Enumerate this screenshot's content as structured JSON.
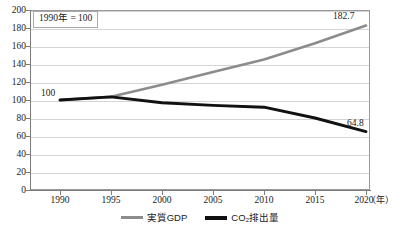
{
  "chart_data": {
    "type": "line",
    "title": "",
    "subtitle": "",
    "note": "1990年 = 100",
    "xlabel": "年",
    "ylabel": "",
    "x": [
      1990,
      1995,
      2000,
      2005,
      2010,
      2015,
      2020
    ],
    "categories": [
      "1990",
      "1995",
      "2000",
      "2005",
      "2010",
      "2015",
      "2020"
    ],
    "xlim": [
      1988,
      2021.5
    ],
    "ylim": [
      0,
      200
    ],
    "yticks": [
      0,
      20,
      40,
      60,
      80,
      100,
      120,
      140,
      160,
      180,
      200
    ],
    "ytick_labels": [
      "0",
      "20",
      "40",
      "60",
      "80",
      "100",
      "120",
      "140",
      "160",
      "180",
      "200"
    ],
    "grid": true,
    "legend_position": "bottom-center",
    "series": [
      {
        "name": "実質GDP",
        "color": "#8c8c8c",
        "values": [
          100.0,
          103.5,
          117.0,
          131.0,
          145.0,
          163.0,
          182.7
        ]
      },
      {
        "name": "CO₂排出量",
        "color": "#111111",
        "values": [
          100.0,
          103.5,
          97.0,
          94.0,
          92.0,
          80.0,
          64.8
        ]
      }
    ],
    "annotations": [
      {
        "text": "100",
        "x": 1990,
        "y": 100,
        "series": "both-start"
      },
      {
        "text": "182.7",
        "x": 2020,
        "y": 182.7,
        "series": "実質GDP"
      },
      {
        "text": "64.8",
        "x": 2020,
        "y": 64.8,
        "series": "CO₂排出量"
      }
    ]
  },
  "axis": {
    "y_ticks": [
      "200",
      "180",
      "160",
      "140",
      "120",
      "100",
      "80",
      "60",
      "40",
      "20",
      "0"
    ],
    "x_ticks": [
      "1990",
      "1995",
      "2000",
      "2005",
      "2010",
      "2015",
      "2020"
    ],
    "x_unit": "（年）"
  },
  "note_box": {
    "text": "1990年 = 100"
  },
  "labels": {
    "start": "100",
    "gdp_end": "182.7",
    "co2_end": "64.8"
  },
  "legend": {
    "items": [
      {
        "label": "実質GDP",
        "color": "#8c8c8c"
      },
      {
        "label": "CO₂排出量",
        "color": "#111111"
      }
    ]
  }
}
